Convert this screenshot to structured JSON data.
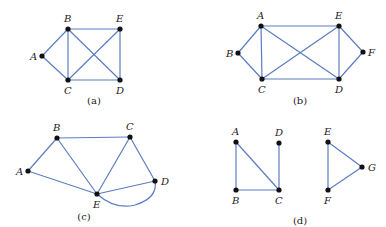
{
  "figure": {
    "edge_color": "#5b7cc0",
    "vertex_color": "#111111",
    "graphs": [
      {
        "id": "a",
        "caption": "(a)",
        "caption_pos": [
          94,
          104
        ],
        "vertices": [
          {
            "label": "A",
            "x": 42,
            "y": 56,
            "lx": 30,
            "ly": 60
          },
          {
            "label": "B",
            "x": 68,
            "y": 29,
            "lx": 64,
            "ly": 22
          },
          {
            "label": "E",
            "x": 120,
            "y": 29,
            "lx": 116,
            "ly": 22
          },
          {
            "label": "C",
            "x": 68,
            "y": 80,
            "lx": 64,
            "ly": 94
          },
          {
            "label": "D",
            "x": 120,
            "y": 80,
            "lx": 116,
            "ly": 94
          }
        ],
        "edges": [
          [
            "A",
            "B"
          ],
          [
            "A",
            "C"
          ],
          [
            "B",
            "E"
          ],
          [
            "B",
            "C"
          ],
          [
            "B",
            "D"
          ],
          [
            "C",
            "E"
          ],
          [
            "C",
            "D"
          ],
          [
            "E",
            "D"
          ]
        ]
      },
      {
        "id": "b",
        "caption": "(b)",
        "caption_pos": [
          300,
          104
        ],
        "vertices": [
          {
            "label": "A",
            "x": 261,
            "y": 26,
            "lx": 257,
            "ly": 19
          },
          {
            "label": "E",
            "x": 339,
            "y": 26,
            "lx": 335,
            "ly": 19
          },
          {
            "label": "B",
            "x": 238,
            "y": 53,
            "lx": 226,
            "ly": 57
          },
          {
            "label": "F",
            "x": 363,
            "y": 52,
            "lx": 368,
            "ly": 56
          },
          {
            "label": "C",
            "x": 262,
            "y": 79,
            "lx": 258,
            "ly": 93
          },
          {
            "label": "D",
            "x": 339,
            "y": 79,
            "lx": 335,
            "ly": 93
          }
        ],
        "edges": [
          [
            "A",
            "B"
          ],
          [
            "A",
            "E"
          ],
          [
            "A",
            "C"
          ],
          [
            "A",
            "D"
          ],
          [
            "B",
            "C"
          ],
          [
            "C",
            "E"
          ],
          [
            "C",
            "D"
          ],
          [
            "E",
            "D"
          ],
          [
            "E",
            "F"
          ],
          [
            "F",
            "D"
          ]
        ]
      },
      {
        "id": "c",
        "caption": "(c)",
        "caption_pos": [
          84,
          220
        ],
        "vertices": [
          {
            "label": "B",
            "x": 57,
            "y": 138,
            "lx": 53,
            "ly": 131
          },
          {
            "label": "C",
            "x": 130,
            "y": 137,
            "lx": 126,
            "ly": 130
          },
          {
            "label": "A",
            "x": 28,
            "y": 171,
            "lx": 16,
            "ly": 175
          },
          {
            "label": "D",
            "x": 155,
            "y": 181,
            "lx": 161,
            "ly": 185
          },
          {
            "label": "E",
            "x": 97,
            "y": 194,
            "lx": 93,
            "ly": 208
          }
        ],
        "edges": [
          [
            "A",
            "B"
          ],
          [
            "A",
            "E"
          ],
          [
            "B",
            "C"
          ],
          [
            "B",
            "E"
          ],
          [
            "C",
            "E"
          ],
          [
            "C",
            "D"
          ],
          [
            "E",
            "D"
          ]
        ],
        "curved_edges": [
          {
            "from": "E",
            "to": "D",
            "path": "M97,194 Q115,210 135,205 Q158,198 155,181"
          }
        ]
      },
      {
        "id": "d",
        "caption": "(d)",
        "caption_pos": [
          300,
          224
        ],
        "vertices": [
          {
            "label": "A",
            "x": 236,
            "y": 142,
            "lx": 232,
            "ly": 135
          },
          {
            "label": "D",
            "x": 279,
            "y": 143,
            "lx": 275,
            "ly": 136
          },
          {
            "label": "B",
            "x": 236,
            "y": 190,
            "lx": 232,
            "ly": 204
          },
          {
            "label": "C",
            "x": 279,
            "y": 190,
            "lx": 275,
            "ly": 204
          },
          {
            "label": "E",
            "x": 328,
            "y": 142,
            "lx": 324,
            "ly": 135
          },
          {
            "label": "G",
            "x": 362,
            "y": 167,
            "lx": 368,
            "ly": 171
          },
          {
            "label": "F",
            "x": 328,
            "y": 190,
            "lx": 324,
            "ly": 204
          }
        ],
        "edges": [
          [
            "A",
            "B"
          ],
          [
            "A",
            "C"
          ],
          [
            "B",
            "C"
          ],
          [
            "D",
            "C"
          ],
          [
            "E",
            "G"
          ],
          [
            "E",
            "F"
          ],
          [
            "F",
            "G"
          ]
        ]
      }
    ]
  }
}
